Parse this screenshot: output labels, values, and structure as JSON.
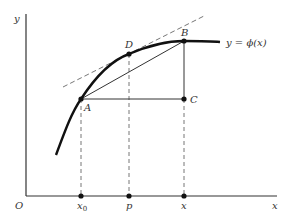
{
  "diagram": {
    "axes": {
      "origin_label": "O",
      "x_label": "x",
      "y_label": "y"
    },
    "curve_label": "y = ϕ(x)",
    "points": {
      "A": "A",
      "B": "B",
      "C": "C",
      "D": "D"
    },
    "x_ticks": {
      "x0_main": "x",
      "x0_sub": "0",
      "p": "p",
      "x": "x"
    },
    "colors": {
      "line": "#222222",
      "dashed": "#666666"
    }
  }
}
